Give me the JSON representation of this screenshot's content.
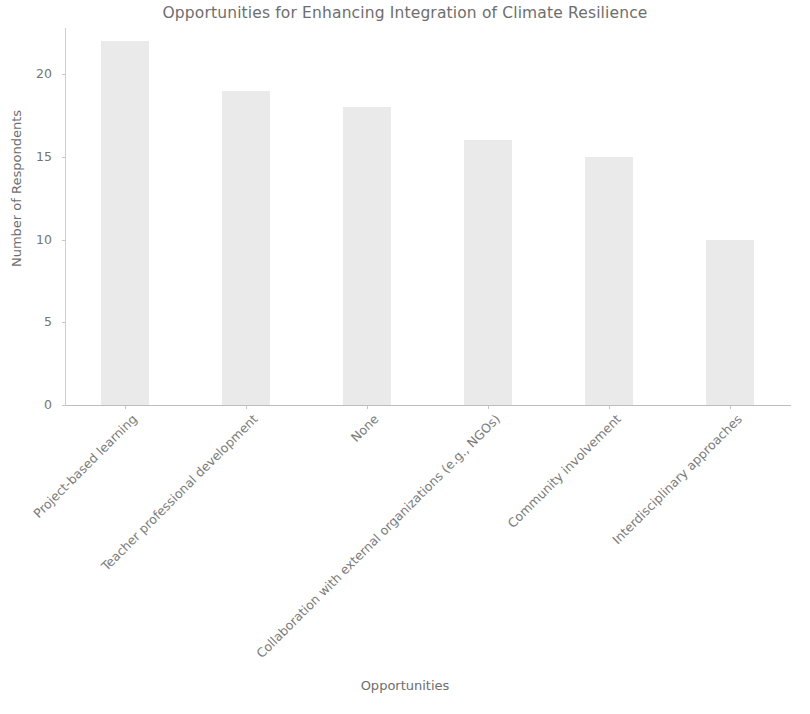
{
  "chart_data": {
    "type": "bar",
    "title": "Opportunities for Enhancing Integration of Climate Resilience",
    "xlabel": "Opportunities",
    "ylabel": "Number of Respondents",
    "categories": [
      "Project-based learning",
      "Teacher professional development",
      "None",
      "Collaboration with external organizations (e.g., NGOs)",
      "Community involvement",
      "Interdisciplinary approaches"
    ],
    "values": [
      22,
      19,
      18,
      16,
      15,
      10
    ],
    "ylim": [
      0,
      22.8
    ],
    "yticks": [
      0,
      5,
      10,
      15,
      20
    ],
    "ytick_labels": [
      "0",
      "5",
      "10",
      "15",
      "20"
    ],
    "grid": false,
    "legend": false,
    "bar_color": "#eaeaea",
    "text_color": "#6e6e6e",
    "axis_color": "#c8c8c8",
    "background": "#ffffff",
    "xtick_rotation": -45
  }
}
